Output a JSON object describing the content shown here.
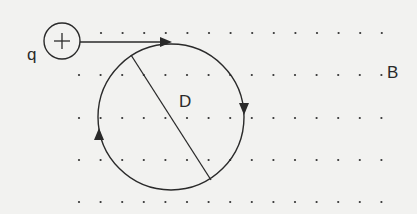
{
  "diagram": {
    "type": "physics-magnetic-field",
    "charge": {
      "label": "q",
      "sign": "+"
    },
    "field_label": "B",
    "diameter_label": "D",
    "field_direction": "out-of-page (dots)",
    "colors": {
      "ink": "#2a2a2a",
      "background": "#f2f2f0"
    }
  }
}
